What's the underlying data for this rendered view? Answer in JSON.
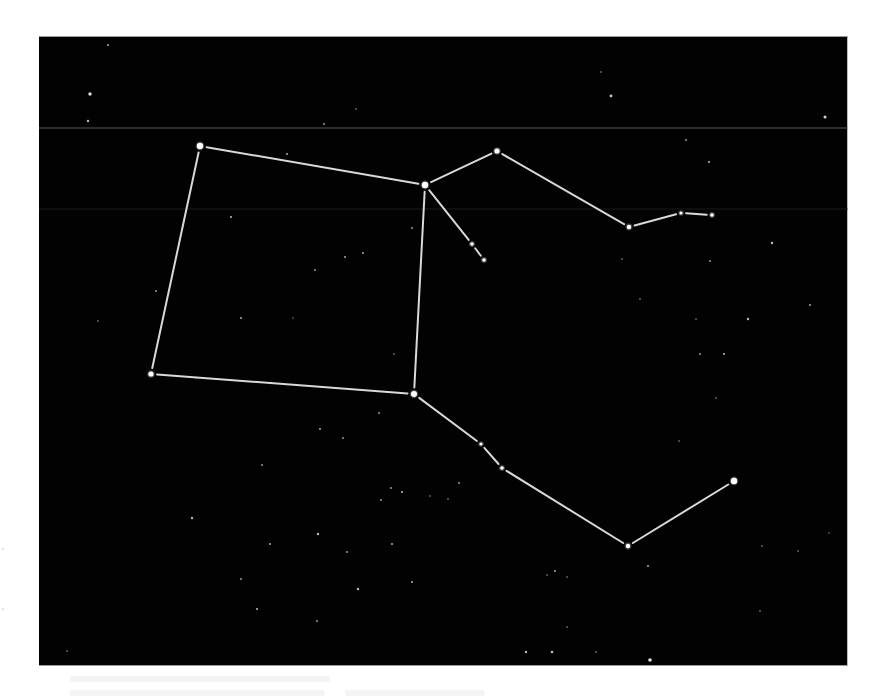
{
  "image": {
    "subject": "star-chart-constellation",
    "background_color": "#020202",
    "line_color": "#d9d9d9",
    "star_color": "#ffffff",
    "plate": {
      "x": 39,
      "y": 36,
      "width": 809,
      "height": 630
    },
    "seam_lines": [
      {
        "y": 127,
        "color": "#6e6e6e",
        "opacity": 0.8
      },
      {
        "y": 208,
        "color": "#2a2a2a",
        "opacity": 0.6
      }
    ]
  },
  "constellation": {
    "stars": [
      {
        "id": "s1",
        "x": 200,
        "y": 145,
        "r": 3.2
      },
      {
        "id": "s2",
        "x": 425,
        "y": 184,
        "r": 3.2
      },
      {
        "id": "s3",
        "x": 151,
        "y": 373,
        "r": 2.6
      },
      {
        "id": "s4",
        "x": 414,
        "y": 393,
        "r": 3.0
      },
      {
        "id": "s5",
        "x": 497,
        "y": 150,
        "r": 2.6
      },
      {
        "id": "s6",
        "x": 629,
        "y": 226,
        "r": 2.2
      },
      {
        "id": "s7",
        "x": 681,
        "y": 212,
        "r": 1.6
      },
      {
        "id": "s8",
        "x": 712,
        "y": 214,
        "r": 1.8
      },
      {
        "id": "s9",
        "x": 472,
        "y": 243,
        "r": 1.8
      },
      {
        "id": "s10",
        "x": 484,
        "y": 259,
        "r": 1.8
      },
      {
        "id": "s11",
        "x": 481,
        "y": 443,
        "r": 1.6
      },
      {
        "id": "s12",
        "x": 502,
        "y": 467,
        "r": 1.8
      },
      {
        "id": "s13",
        "x": 628,
        "y": 545,
        "r": 2.2
      },
      {
        "id": "s14",
        "x": 734,
        "y": 480,
        "r": 3.2
      }
    ],
    "lines": [
      [
        "s1",
        "s2"
      ],
      [
        "s1",
        "s3"
      ],
      [
        "s3",
        "s4"
      ],
      [
        "s2",
        "s4"
      ],
      [
        "s2",
        "s5"
      ],
      [
        "s5",
        "s6"
      ],
      [
        "s6",
        "s7"
      ],
      [
        "s7",
        "s8"
      ],
      [
        "s2",
        "s9"
      ],
      [
        "s9",
        "s10"
      ],
      [
        "s4",
        "s11"
      ],
      [
        "s11",
        "s12"
      ],
      [
        "s12",
        "s13"
      ],
      [
        "s13",
        "s14"
      ]
    ]
  },
  "field_stars": [
    [
      108,
      44,
      1.0
    ],
    [
      90,
      93,
      1.7
    ],
    [
      88,
      120,
      1.2
    ],
    [
      324,
      123,
      0.9
    ],
    [
      287,
      153,
      1.0
    ],
    [
      356,
      108,
      0.8
    ],
    [
      611,
      95,
      1.4
    ],
    [
      825,
      116,
      1.5
    ],
    [
      686,
      139,
      0.9
    ],
    [
      709,
      161,
      1.1
    ],
    [
      601,
      71,
      0.8
    ],
    [
      231,
      216,
      1.1
    ],
    [
      156,
      290,
      0.9
    ],
    [
      241,
      317,
      1.0
    ],
    [
      315,
      269,
      0.9
    ],
    [
      345,
      256,
      1.0
    ],
    [
      363,
      252,
      1.0
    ],
    [
      293,
      317,
      0.7
    ],
    [
      412,
      227,
      0.9
    ],
    [
      394,
      353,
      0.8
    ],
    [
      98,
      320,
      0.8
    ],
    [
      196,
      377,
      0.7
    ],
    [
      772,
      242,
      1.2
    ],
    [
      810,
      304,
      1.0
    ],
    [
      748,
      318,
      1.2
    ],
    [
      724,
      353,
      1.1
    ],
    [
      700,
      353,
      0.9
    ],
    [
      710,
      260,
      0.9
    ],
    [
      679,
      440,
      0.8
    ],
    [
      622,
      258,
      0.8
    ],
    [
      640,
      298,
      0.8
    ],
    [
      696,
      318,
      0.8
    ],
    [
      716,
      397,
      0.8
    ],
    [
      320,
      428,
      1.0
    ],
    [
      343,
      437,
      0.9
    ],
    [
      262,
      464,
      0.9
    ],
    [
      192,
      517,
      1.2
    ],
    [
      270,
      543,
      1.0
    ],
    [
      318,
      533,
      1.2
    ],
    [
      347,
      551,
      0.9
    ],
    [
      358,
      588,
      1.2
    ],
    [
      412,
      581,
      1.0
    ],
    [
      241,
      578,
      0.9
    ],
    [
      257,
      608,
      1.1
    ],
    [
      317,
      620,
      0.9
    ],
    [
      392,
      543,
      1.0
    ],
    [
      402,
      491,
      1.1
    ],
    [
      391,
      487,
      0.9
    ],
    [
      381,
      499,
      0.9
    ],
    [
      379,
      412,
      0.9
    ],
    [
      67,
      650,
      0.8
    ],
    [
      459,
      482,
      0.9
    ],
    [
      448,
      498,
      0.8
    ],
    [
      555,
      570,
      1.0
    ],
    [
      547,
      574,
      0.8
    ],
    [
      567,
      576,
      0.8
    ],
    [
      648,
      565,
      1.0
    ],
    [
      760,
      610,
      0.8
    ],
    [
      596,
      651,
      0.8
    ],
    [
      552,
      651,
      1.3
    ],
    [
      526,
      651,
      1.2
    ],
    [
      650,
      659,
      1.8
    ],
    [
      567,
      626,
      0.8
    ],
    [
      762,
      545,
      0.8
    ],
    [
      798,
      550,
      0.8
    ],
    [
      829,
      532,
      0.7
    ],
    [
      430,
      495,
      0.8
    ]
  ],
  "bleed_through_text": [
    {
      "x": 70,
      "y": 676,
      "width": 260
    },
    {
      "x": 70,
      "y": 690,
      "width": 255
    },
    {
      "x": 345,
      "y": 690,
      "width": 140
    }
  ]
}
